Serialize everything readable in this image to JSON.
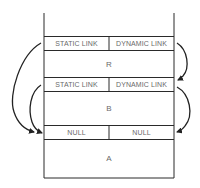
{
  "diagram": {
    "type": "activation-record-stack",
    "frames": [
      {
        "name": "R",
        "links": {
          "static": "STATIC LINK",
          "dynamic": "DYNAMIC LINK"
        }
      },
      {
        "name": "B",
        "links": {
          "static": "STATIC LINK",
          "dynamic": "DYNAMIC LINK"
        }
      },
      {
        "name": "A",
        "links": {
          "static": "NULL",
          "dynamic": "NULL"
        }
      }
    ],
    "arrows": [
      {
        "from": "R.static_link",
        "to": "A.links",
        "side": "left"
      },
      {
        "from": "R.dynamic_link",
        "to": "B.links",
        "side": "right"
      },
      {
        "from": "B.static_link",
        "to": "A.links",
        "side": "left"
      },
      {
        "from": "B.dynamic_link",
        "to": "A.links",
        "side": "right"
      }
    ],
    "colors": {
      "line": "#2a2a2a",
      "text": "#6a6a6a",
      "background": "#ffffff"
    }
  }
}
